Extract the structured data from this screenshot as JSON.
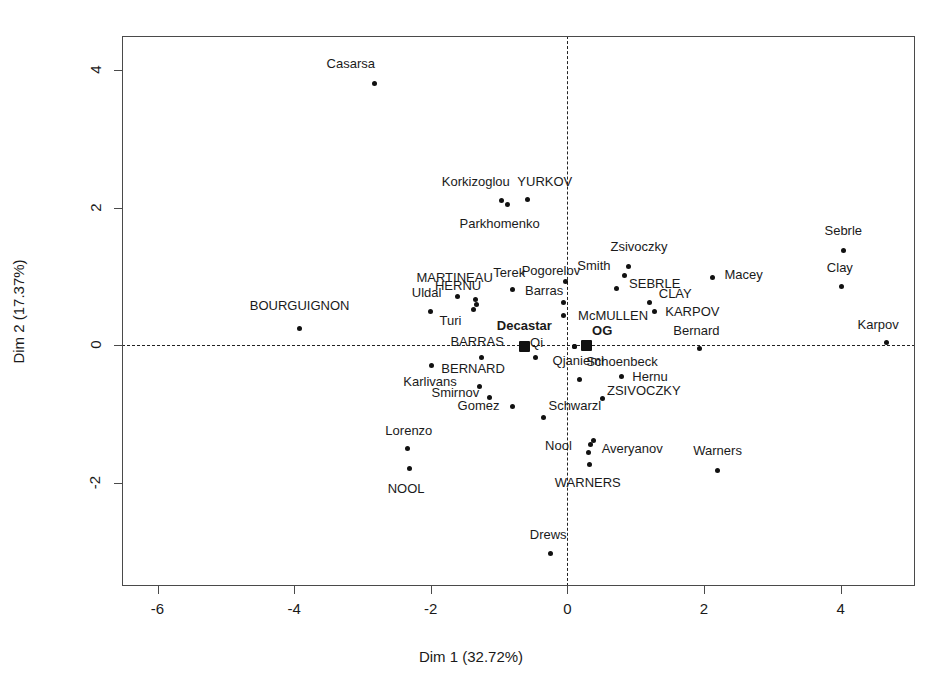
{
  "chart_data": {
    "type": "scatter",
    "title": "",
    "xlabel": "Dim 1 (32.72%)",
    "ylabel": "Dim 2 (17.37%)",
    "xlim": [
      -6.52,
      5.09
    ],
    "ylim": [
      -3.49,
      4.49
    ],
    "xticks": [
      -6,
      -4,
      -2,
      0,
      2,
      4
    ],
    "yticks": [
      -2,
      0,
      2,
      4
    ],
    "grid": false,
    "legend": null,
    "reference_lines": {
      "horizontal": 0,
      "vertical": 0,
      "style": "dashed"
    },
    "series": [
      {
        "name": "individuals",
        "marker": "circle",
        "points": [
          {
            "label": "Casarsa",
            "x": -2.83,
            "y": 3.8,
            "label_dx": -0.34,
            "label_dy": 0.3
          },
          {
            "label": "Korkizoglou",
            "x": -0.97,
            "y": 2.1,
            "label_dx": -0.37,
            "label_dy": 0.29
          },
          {
            "label": "YURKOV",
            "x": -0.58,
            "y": 2.12,
            "label_dx": 0.25,
            "label_dy": 0.26
          },
          {
            "label": "Parkhomenko",
            "x": -0.87,
            "y": 2.04,
            "label_dx": -0.12,
            "label_dy": -0.26
          },
          {
            "label": "Sebrle",
            "x": 4.04,
            "y": 1.38,
            "label_dx": 0.0,
            "label_dy": 0.29
          },
          {
            "label": "Zsivoczky",
            "x": 0.9,
            "y": 1.15,
            "label_dx": 0.15,
            "label_dy": 0.29
          },
          {
            "label": "Smith",
            "x": 0.84,
            "y": 1.02,
            "label_dx": -0.45,
            "label_dy": 0.15
          },
          {
            "label": "Macey",
            "x": 2.12,
            "y": 0.99,
            "label_dx": 0.46,
            "label_dy": 0.04
          },
          {
            "label": "Clay",
            "x": 4.01,
            "y": 0.86,
            "label_dx": -0.02,
            "label_dy": 0.28
          },
          {
            "label": "Pogorelov",
            "x": -0.02,
            "y": 0.93,
            "label_dx": -0.22,
            "label_dy": 0.16
          },
          {
            "label": "SEBRLE",
            "x": 0.72,
            "y": 0.82,
            "label_dx": 0.56,
            "label_dy": 0.08
          },
          {
            "label": "CLAY",
            "x": 1.2,
            "y": 0.63,
            "label_dx": 0.38,
            "label_dy": 0.13
          },
          {
            "label": "Terek",
            "x": -0.8,
            "y": 0.81,
            "label_dx": -0.05,
            "label_dy": 0.26
          },
          {
            "label": "MARTINEAU",
            "x": -1.61,
            "y": 0.71,
            "label_dx": -0.04,
            "label_dy": 0.29
          },
          {
            "label": "HERNU",
            "x": -1.35,
            "y": 0.66,
            "label_dx": -0.25,
            "label_dy": 0.21
          },
          {
            "label": "Barras",
            "x": -0.05,
            "y": 0.62,
            "label_dx": -0.29,
            "label_dy": 0.19
          },
          {
            "label": "Uldal",
            "x": -2.01,
            "y": 0.49,
            "label_dx": -0.05,
            "label_dy": 0.28
          },
          {
            "label": "Turi",
            "x": -1.37,
            "y": 0.52,
            "label_dx": -0.34,
            "label_dy": -0.15
          },
          {
            "label": "KARPOV",
            "x": 1.28,
            "y": 0.5,
            "label_dx": 0.55,
            "label_dy": 0.0
          },
          {
            "label": "McMULLEN",
            "x": -0.06,
            "y": 0.44,
            "label_dx": 0.73,
            "label_dy": 0.0
          },
          {
            "label": "BOURGUIGNON",
            "x": -3.92,
            "y": 0.24,
            "label_dx": 0.0,
            "label_dy": 0.34
          },
          {
            "label": "Karpov",
            "x": 4.67,
            "y": 0.04,
            "label_dx": -0.12,
            "label_dy": 0.27
          },
          {
            "label": "Bernard",
            "x": 1.94,
            "y": -0.05,
            "label_dx": -0.05,
            "label_dy": 0.28
          },
          {
            "label": "Schoenbeck",
            "x": 0.1,
            "y": -0.02,
            "label_dx": 0.7,
            "label_dy": -0.2
          },
          {
            "label": "Qi",
            "x": -0.47,
            "y": -0.18,
            "label_dx": 0.02,
            "label_dy": 0.23
          },
          {
            "label": "BARRAS",
            "x": -1.25,
            "y": -0.17,
            "label_dx": -0.07,
            "label_dy": 0.23
          },
          {
            "label": "Karlivans",
            "x": -1.99,
            "y": -0.29,
            "label_dx": -0.02,
            "label_dy": -0.23
          },
          {
            "label": "Qjaniemi",
            "x": 0.18,
            "y": -0.49,
            "label_dx": -0.02,
            "label_dy": 0.28
          },
          {
            "label": "Hernu",
            "x": 0.79,
            "y": -0.45,
            "label_dx": 0.42,
            "label_dy": 0.01
          },
          {
            "label": "BERNARD",
            "x": -1.29,
            "y": -0.6,
            "label_dx": -0.09,
            "label_dy": 0.27
          },
          {
            "label": "Smirnov",
            "x": -1.14,
            "y": -0.76,
            "label_dx": -0.5,
            "label_dy": 0.09
          },
          {
            "label": "ZSIVOCZKY",
            "x": 0.52,
            "y": -0.77,
            "label_dx": 0.6,
            "label_dy": 0.12
          },
          {
            "label": "Gomez",
            "x": -0.8,
            "y": -0.88,
            "label_dx": -0.5,
            "label_dy": 0.01
          },
          {
            "label": "Schwarzl",
            "x": -0.35,
            "y": -1.04,
            "label_dx": 0.46,
            "label_dy": 0.18
          },
          {
            "label": "Lorenzo",
            "x": -2.34,
            "y": -1.5,
            "label_dx": 0.02,
            "label_dy": 0.28
          },
          {
            "label": "Averyanov",
            "x": 0.39,
            "y": -1.38,
            "label_dx": 0.56,
            "label_dy": -0.11
          },
          {
            "label": "Nool",
            "x": 0.31,
            "y": -1.55,
            "label_dx": -0.44,
            "label_dy": 0.1
          },
          {
            "label": "Warners",
            "x": 2.2,
            "y": -1.82,
            "label_dx": 0.0,
            "label_dy": 0.3
          },
          {
            "label": "WARNERS",
            "x": 0.32,
            "y": -1.72,
            "label_dx": -0.02,
            "label_dy": -0.26
          },
          {
            "label": "NOOL",
            "x": -2.31,
            "y": -1.79,
            "label_dx": -0.05,
            "label_dy": -0.28
          },
          {
            "label": "Drews",
            "x": -0.25,
            "y": -3.02,
            "label_dx": -0.03,
            "label_dy": 0.29
          }
        ]
      },
      {
        "name": "competition-centroids",
        "marker": "square",
        "bold_labels": true,
        "points": [
          {
            "label": "Decastar",
            "x": -0.63,
            "y": -0.01,
            "label_dx": 0.0,
            "label_dy": 0.3
          },
          {
            "label": "OG",
            "x": 0.28,
            "y": 0.0,
            "label_dx": 0.23,
            "label_dy": 0.22
          }
        ]
      },
      {
        "name": "overlapping-extra-markers",
        "marker": "circle",
        "points": [
          {
            "label": "",
            "x": -1.33,
            "y": 0.6
          },
          {
            "label": "",
            "x": 0.34,
            "y": -1.44
          },
          {
            "label": "",
            "x": 0.1,
            "y": -0.02
          }
        ]
      }
    ]
  },
  "axes": {
    "x": {
      "title": "Dim 1 (32.72%)",
      "tick_labels": [
        "-6",
        "-4",
        "-2",
        "0",
        "2",
        "4"
      ]
    },
    "y": {
      "title": "Dim 2 (17.37%)",
      "tick_labels": [
        "4",
        "2",
        "0",
        "-2"
      ]
    }
  },
  "style": {
    "point_color": "#111111",
    "frame_color": "#4a4a4a",
    "text_color": "#1a1a1a",
    "background": "#ffffff"
  }
}
